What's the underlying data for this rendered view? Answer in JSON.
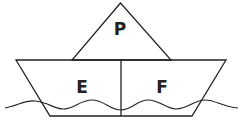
{
  "diagram": {
    "labels": {
      "sail": "P",
      "hull_left": "E",
      "hull_right": "F"
    },
    "colors": {
      "stroke": "#222222",
      "background": "#ffffff"
    }
  }
}
